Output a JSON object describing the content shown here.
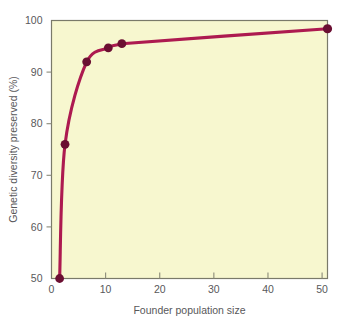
{
  "chart_data": {
    "type": "line",
    "title": "",
    "subtitle": "",
    "xlabel": "Founder population size",
    "ylabel": "Genetic diversity preserved (%)",
    "xlim": [
      0,
      51
    ],
    "ylim": [
      50,
      100
    ],
    "xticks": [
      0,
      10,
      20,
      30,
      40,
      50
    ],
    "xticklabels": [
      "0",
      "10",
      "20",
      "30",
      "40",
      "50"
    ],
    "yticks": [
      50,
      60,
      70,
      80,
      90,
      100
    ],
    "yticklabels": [
      "50",
      "60",
      "70",
      "80",
      "90",
      "100"
    ],
    "grid": false,
    "legend": "none",
    "plot_background": "#f7f7cf",
    "series": [
      {
        "name": "Genetic diversity preserved",
        "color": "#ad1a50",
        "marker": "circle",
        "marker_color": "#6b0f32",
        "x": [
          1.5,
          2.5,
          6.5,
          10.5,
          13.0,
          51.0
        ],
        "y": [
          50.0,
          76.0,
          92.0,
          94.7,
          95.5,
          98.4
        ]
      }
    ],
    "annotations": []
  },
  "axes": {
    "x_tick_labels": [
      "0",
      "10",
      "20",
      "30",
      "40",
      "50"
    ],
    "y_tick_labels": [
      "50",
      "60",
      "70",
      "80",
      "90",
      "100"
    ],
    "x_axis_title": "Founder population size",
    "y_axis_title": "Genetic diversity preserved (%)"
  },
  "style": {
    "frame_color": "#7a7a6a",
    "tick_color": "#8a8a78",
    "text_color": "#58585a",
    "curve_color": "#ad1a50",
    "marker_color": "#6b0f32",
    "panel_fill": "#f7f7cf",
    "page_background": "#ffffff"
  }
}
